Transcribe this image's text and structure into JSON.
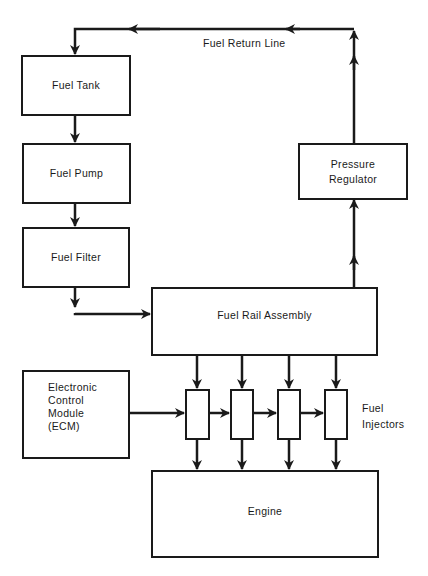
{
  "diagram": {
    "title": "",
    "nodes": {
      "fuel_tank": {
        "label": "Fuel Tank"
      },
      "fuel_pump": {
        "label": "Fuel Pump"
      },
      "fuel_filter": {
        "label": "Fuel Filter"
      },
      "fuel_rail": {
        "label": "Fuel Rail Assembly"
      },
      "pressure_regulator": {
        "line1": "Pressure",
        "line2": "Regulator"
      },
      "ecm": {
        "line1": "Electronic",
        "line2": "Control",
        "line3": "Module",
        "line4": "(ECM)"
      },
      "engine": {
        "label": "Engine"
      }
    },
    "injectors": {
      "count": 4,
      "line1": "Fuel",
      "line2": "Injectors"
    },
    "return_line": {
      "label": "Fuel Return Line"
    },
    "edges": [
      {
        "from": "Fuel Tank",
        "to": "Fuel Pump"
      },
      {
        "from": "Fuel Pump",
        "to": "Fuel Filter"
      },
      {
        "from": "Fuel Filter",
        "to": "Fuel Rail Assembly"
      },
      {
        "from": "Fuel Rail Assembly",
        "to": "Fuel Injectors"
      },
      {
        "from": "Electronic Control Module (ECM)",
        "to": "Fuel Injectors"
      },
      {
        "from": "Fuel Injectors",
        "to": "Engine"
      },
      {
        "from": "Fuel Rail Assembly",
        "to": "Pressure Regulator"
      },
      {
        "from": "Pressure Regulator",
        "to": "Fuel Tank",
        "via": "Fuel Return Line"
      }
    ],
    "colors": {
      "line": "#1a1a1a",
      "background": "#ffffff"
    }
  }
}
